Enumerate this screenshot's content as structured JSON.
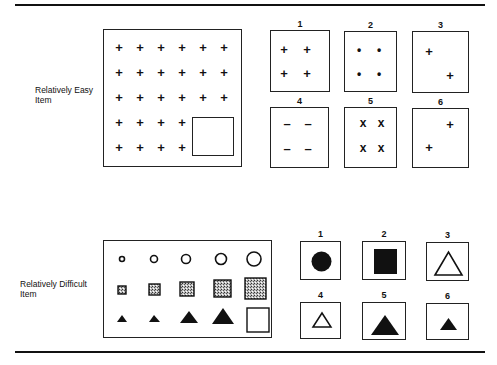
{
  "rules": {
    "top_y": 5,
    "bottom_y": 352
  },
  "easy_item": {
    "label_line1": "Relatively Easy",
    "label_line2": "Item",
    "matrix": {
      "symbol": "+",
      "rows": [
        [
          "+",
          "+",
          "+",
          "+",
          "+",
          "+"
        ],
        [
          "+",
          "+",
          "+",
          "+",
          "+",
          "+"
        ],
        [
          "+",
          "+",
          "+",
          "+",
          "+",
          "+"
        ],
        [
          "+",
          "+",
          "+",
          "+",
          "blank",
          "blank"
        ],
        [
          "+",
          "+",
          "+",
          "+",
          "blank",
          "blank"
        ]
      ],
      "missing_region": "empty-square-bottom-right"
    },
    "options": [
      {
        "number": "1",
        "content": "four plus signs in 2x2 grid",
        "glyph": "+"
      },
      {
        "number": "2",
        "content": "four dots in 2x2 grid",
        "glyph": "•"
      },
      {
        "number": "3",
        "content": "two plus signs, diagonal top-left to bottom-right",
        "glyph": "+"
      },
      {
        "number": "4",
        "content": "four minus signs in 2x2 grid",
        "glyph": "–"
      },
      {
        "number": "5",
        "content": "four X marks in 2x2 grid",
        "glyph": "x"
      },
      {
        "number": "6",
        "content": "two plus signs, diagonal top-right to bottom-left",
        "glyph": "+"
      }
    ]
  },
  "difficult_item": {
    "label_line1": "Relatively Difficult",
    "label_line2": "Item",
    "matrix": {
      "rows": [
        {
          "shape": "open-circle",
          "sizes": [
            "smallest",
            "small",
            "medium",
            "large",
            "largest"
          ]
        },
        {
          "shape": "stippled-square",
          "sizes": [
            "smallest",
            "small",
            "medium",
            "large",
            "largest"
          ]
        },
        {
          "shape": "filled-triangle",
          "sizes": [
            "smallest",
            "small",
            "medium",
            "large",
            "blank"
          ]
        }
      ],
      "missing_region": "empty-square-bottom-right"
    },
    "options": [
      {
        "number": "1",
        "content": "filled circle"
      },
      {
        "number": "2",
        "content": "filled square"
      },
      {
        "number": "3",
        "content": "open triangle, large"
      },
      {
        "number": "4",
        "content": "open triangle, small"
      },
      {
        "number": "5",
        "content": "filled triangle, large"
      },
      {
        "number": "6",
        "content": "filled triangle, small"
      }
    ]
  }
}
